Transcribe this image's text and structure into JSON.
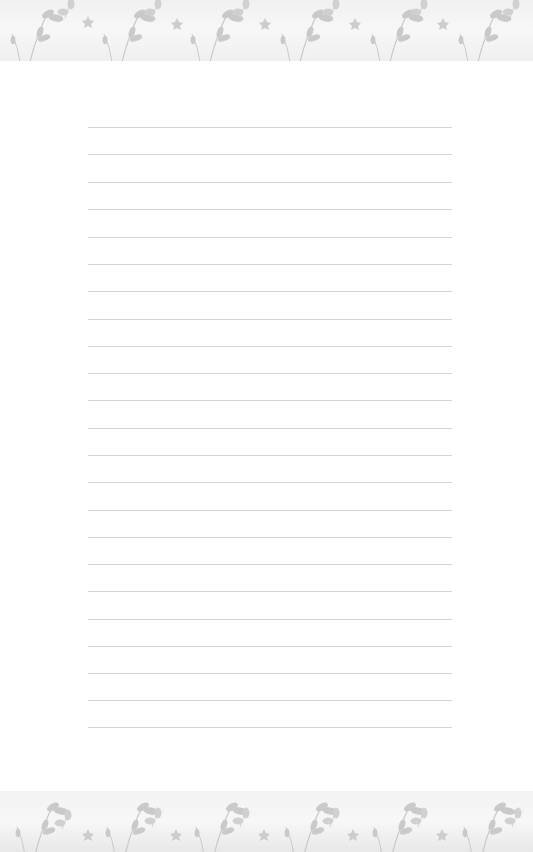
{
  "page": {
    "type": "lined-stationery",
    "background_color": "#ffffff",
    "line_color": "#d4d4d4",
    "line_count": 23,
    "line_positions_y": [
      127,
      154,
      182,
      209,
      237,
      264,
      291,
      319,
      346,
      373,
      400,
      428,
      455,
      482,
      510,
      537,
      564,
      591,
      619,
      646,
      673,
      700,
      727
    ]
  },
  "borders": {
    "top": {
      "pattern": "floral-leaves",
      "color": "#c8c8c8"
    },
    "bottom": {
      "pattern": "floral-leaves",
      "color": "#c8c8c8"
    }
  }
}
